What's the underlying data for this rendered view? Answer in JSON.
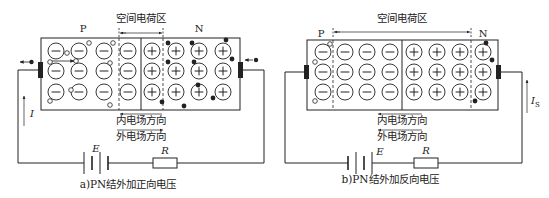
{
  "diagrams": [
    {
      "id": "forward",
      "caption": "a)PN结外加正向电压",
      "space_charge_label": "空间电荷区",
      "p_label": "P",
      "n_label": "N",
      "inner_field_label": "内电场方向",
      "outer_field_label": "外电场方向",
      "inner_field_direction": "left",
      "outer_field_direction": "right",
      "battery_label": "E",
      "resistor_label": "R",
      "current_label": "I",
      "current_sub": "",
      "space_charge_width": "narrow",
      "rows": 3,
      "negative_ion_columns": 4,
      "positive_ion_columns": 4
    },
    {
      "id": "reverse",
      "caption": "b)PN结外加反向电压",
      "space_charge_label": "空间电荷区",
      "p_label": "P",
      "n_label": "N",
      "inner_field_label": "内电场方向",
      "outer_field_label": "外电场方向",
      "inner_field_direction": "left",
      "outer_field_direction": "left",
      "battery_label": "E",
      "resistor_label": "R",
      "current_label": "I",
      "current_sub": "S",
      "space_charge_width": "wide",
      "rows": 3,
      "negative_ion_columns": 4,
      "positive_ion_columns": 4
    }
  ],
  "symbols": {
    "negative_ion": "⊖",
    "positive_ion": "⊕",
    "hole": "○",
    "electron": "●"
  },
  "colors": {
    "line": "#222222",
    "background": "#ffffff"
  }
}
